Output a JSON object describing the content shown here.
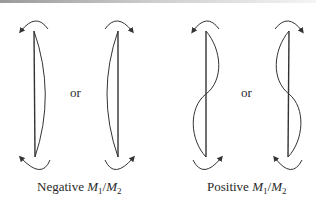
{
  "figure": {
    "groups": [
      {
        "label": {
          "prefix": "Negative ",
          "m1": "M",
          "sub1": "1",
          "slash": "/",
          "m2": "M",
          "sub2": "2"
        },
        "connector": "or",
        "description": "Single curvature columns"
      },
      {
        "label": {
          "prefix": "Positive ",
          "m1": "M",
          "sub1": "1",
          "slash": "/",
          "m2": "M",
          "sub2": "2"
        },
        "connector": "or",
        "description": "Double curvature columns"
      }
    ],
    "colors": {
      "stroke": "#333333",
      "text": "#2a2a2a"
    }
  }
}
